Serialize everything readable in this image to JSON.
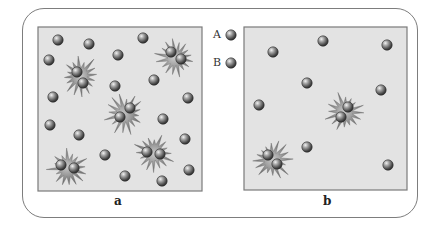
{
  "figure": {
    "panels": [
      {
        "id": "a",
        "label": "a",
        "box": {
          "x": 38,
          "y": 27,
          "w": 164,
          "h": 164
        },
        "singles": [
          [
            58,
            40
          ],
          [
            89,
            44
          ],
          [
            143,
            38
          ],
          [
            49,
            60
          ],
          [
            118,
            55
          ],
          [
            115,
            86
          ],
          [
            154,
            80
          ],
          [
            53,
            97
          ],
          [
            188,
            98
          ],
          [
            50,
            125
          ],
          [
            79,
            135
          ],
          [
            163,
            119
          ],
          [
            105,
            155
          ],
          [
            185,
            139
          ],
          [
            125,
            176
          ],
          [
            162,
            181
          ],
          [
            189,
            170
          ]
        ],
        "complexes": [
          {
            "c": [
              80,
              76
            ],
            "p": [
              [
                77,
                72
              ],
              [
                83,
                83
              ]
            ]
          },
          {
            "c": [
              176,
              58
            ],
            "p": [
              [
                171,
                52
              ],
              [
                181,
                59
              ]
            ]
          },
          {
            "c": [
              125,
              114
            ],
            "p": [
              [
                130,
                108
              ],
              [
                120,
                117
              ]
            ]
          },
          {
            "c": [
              154,
              153
            ],
            "p": [
              [
                147,
                152
              ],
              [
                160,
                154
              ]
            ]
          },
          {
            "c": [
              68,
              168
            ],
            "p": [
              [
                61,
                165
              ],
              [
                74,
                168
              ]
            ]
          }
        ]
      },
      {
        "id": "b",
        "label": "b",
        "box": {
          "x": 244,
          "y": 27,
          "w": 163,
          "h": 163
        },
        "singles": [
          [
            273,
            52
          ],
          [
            323,
            41
          ],
          [
            387,
            45
          ],
          [
            307,
            83
          ],
          [
            381,
            90
          ],
          [
            259,
            105
          ],
          [
            307,
            147
          ],
          [
            388,
            165
          ]
        ],
        "complexes": [
          {
            "c": [
              345,
              112
            ],
            "p": [
              [
                348,
                107
              ],
              [
                341,
                117
              ]
            ]
          },
          {
            "c": [
              272,
              160
            ],
            "p": [
              [
                268,
                155
              ],
              [
                277,
                164
              ]
            ]
          }
        ]
      }
    ],
    "legend": [
      {
        "label": "A",
        "x": 231,
        "y": 35
      },
      {
        "label": "B",
        "x": 231,
        "y": 63
      }
    ],
    "colors": {
      "panel_fill": "#e3e3e3",
      "panel_border": "#7a7a7a",
      "sphere_light": "#d6d6d6",
      "sphere_mid": "#8a8a8a",
      "sphere_dark": "#3a3a3a",
      "star_light": "#b5b5b5",
      "star_dark": "#5e5e5e"
    }
  }
}
